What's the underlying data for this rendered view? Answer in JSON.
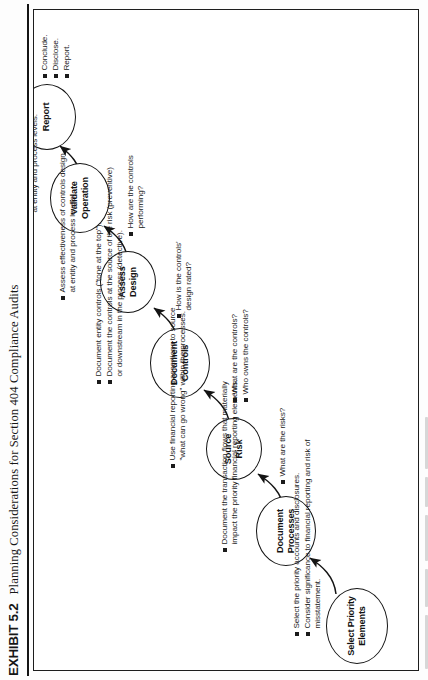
{
  "exhibit": {
    "label": "EXHIBIT 5.2",
    "title": "Planning Considerations for Section 404 Compliance Audits"
  },
  "flow": {
    "nodes": [
      {
        "id": "select-priority-elements",
        "line1": "Select Priority",
        "line2": "Elements"
      },
      {
        "id": "document-processes",
        "line1": "Document",
        "line2": "Processes"
      },
      {
        "id": "source-risk",
        "line1": "Source",
        "line2": "Risk"
      },
      {
        "id": "document-controls",
        "line1": "Document",
        "line2": "Controls"
      },
      {
        "id": "assess-design",
        "line1": "Assess",
        "line2": "Design"
      },
      {
        "id": "validate-operation",
        "line1": "Validate",
        "line2": "Operation"
      },
      {
        "id": "report",
        "line1": "Report",
        "line2": ""
      }
    ]
  },
  "annotations": {
    "select_priority_elements": {
      "bullets": [
        "Select the priority accounts and disclosures.",
        "Consider significance to financial reporting and risk of misstatement."
      ]
    },
    "document_processes": {
      "bullets": [
        "Document the transaction flows that materially impact the priority financial reporting elements."
      ]
    },
    "source_risk": {
      "bullets": [
        "Use financial reporting assertions to source \"what can go wrong\" within the processes."
      ],
      "question": "What are the risks?"
    },
    "document_controls": {
      "bullets": [
        "Document entity controls (\"tone at the top\").",
        "Document the controls at the source of the risk (preventive) or downstream in the process (detective)."
      ],
      "questions": [
        "What are the controls?",
        "Who owns the controls?"
      ]
    },
    "assess_design": {
      "bullets": [
        "Assess effectiveness of controls design at entity and process levels."
      ],
      "question": "How is the controls' design rated?"
    },
    "validate_operation": {
      "bullets": [
        "Test effectiveness of controls operation at entity and process levels."
      ],
      "question": "How are the controls performing?"
    },
    "report": {
      "bullets": [
        "Conclude.",
        "Disclose.",
        "Report."
      ]
    }
  }
}
